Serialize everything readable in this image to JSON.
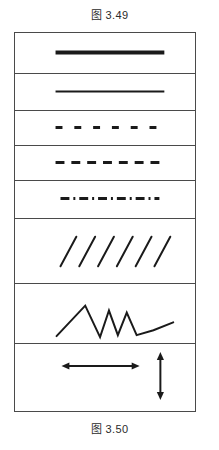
{
  "page": {
    "caption_top": "图 3.49",
    "caption_bottom": "图 3.50",
    "ink_color": "#1a1a1a",
    "border_color": "#4a4a4a",
    "background_color": "#ffffff"
  },
  "panel": {
    "x": 14,
    "y": 32,
    "width": 182,
    "height": 380,
    "row_count": 8
  },
  "samples": [
    {
      "index": 1,
      "name": "thick-solid-line",
      "label": "Thick solid line",
      "style": "solid",
      "stroke_width": 4,
      "top": 0,
      "height": 41,
      "x1": 41,
      "y1": 20,
      "x2": 151,
      "y2": 20
    },
    {
      "index": 2,
      "name": "thin-solid-line",
      "label": "Thin solid line",
      "style": "solid",
      "stroke_width": 2,
      "top": 41,
      "height": 37,
      "x1": 41,
      "y1": 18,
      "x2": 151,
      "y2": 18
    },
    {
      "index": 3,
      "name": "wide-dashed-line",
      "label": "Wide dashed line",
      "style": "dashed",
      "stroke_width": 3,
      "dash_pattern": "7 12",
      "dash_count": 6,
      "top": 78,
      "height": 35,
      "x1": 41,
      "y1": 17,
      "x2": 151,
      "y2": 17
    },
    {
      "index": 4,
      "name": "close-dashed-line",
      "label": "Close dashed line",
      "style": "dashed",
      "stroke_width": 3,
      "dash_pattern": "9 7",
      "dash_count": 7,
      "top": 113,
      "height": 35,
      "x1": 41,
      "y1": 17,
      "x2": 151,
      "y2": 17
    },
    {
      "index": 5,
      "name": "dash-dot-line",
      "label": "Dash-dot line",
      "style": "dash-dot",
      "stroke_width": 3,
      "dash_pattern": "9 4 2 4",
      "top": 148,
      "height": 38,
      "x1": 46,
      "y1": 18,
      "x2": 146,
      "y2": 18
    },
    {
      "index": 6,
      "name": "diagonal-hatch-strokes",
      "label": "Diagonal hatch strokes",
      "style": "hatch",
      "stroke_width": 2,
      "stroke_count": 6,
      "top": 186,
      "height": 65,
      "stroke_start_x": 46,
      "stroke_spacing": 19,
      "stroke_top_y": 18,
      "stroke_bottom_y": 48,
      "stroke_dx": 16
    },
    {
      "index": 7,
      "name": "zigzag-polyline",
      "label": "Zigzag polyline",
      "style": "polyline",
      "stroke_width": 2,
      "points": "42,53 71,22 86,54 95,27 104,52 113,29 123,52 140,47 160,39",
      "top": 251,
      "height": 60
    },
    {
      "index": 8,
      "name": "double-headed-arrows",
      "label": "Double-headed arrows",
      "style": "arrows",
      "stroke_width": 2,
      "top": 311,
      "height": 69,
      "horizontal": {
        "x1": 47,
        "x2": 126,
        "y": 22
      },
      "vertical": {
        "x": 147,
        "y1": 8,
        "y2": 56
      }
    }
  ]
}
